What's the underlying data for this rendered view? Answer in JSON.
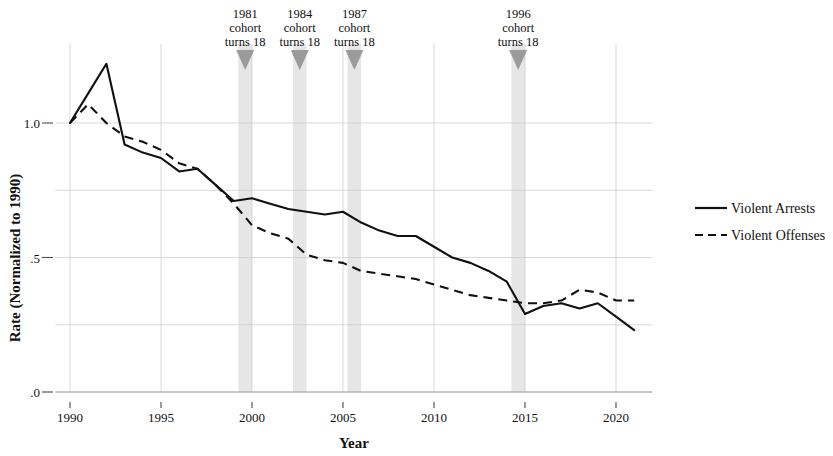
{
  "chart_data": {
    "type": "line",
    "title": "",
    "xlabel": "Year",
    "ylabel": "Rate (Normalized to 1990)",
    "xlim": [
      1989.2,
      2022.0
    ],
    "ylim": [
      0.0,
      1.28
    ],
    "grid": true,
    "legend_position": "right",
    "x_ticks": [
      "1990",
      "1995",
      "2000",
      "2005",
      "2010",
      "2015",
      "2020"
    ],
    "x_tick_values": [
      1990,
      1995,
      2000,
      2005,
      2010,
      2015,
      2020
    ],
    "y_ticks": [
      ".0",
      ".5",
      "1.0"
    ],
    "y_tick_values": [
      0.0,
      0.5,
      1.0
    ],
    "y_gridlines": [
      0.0,
      0.25,
      0.5,
      0.75,
      1.0
    ],
    "x": [
      1990,
      1991,
      1992,
      1993,
      1994,
      1995,
      1996,
      1997,
      1998,
      1999,
      2000,
      2001,
      2002,
      2003,
      2004,
      2005,
      2006,
      2007,
      2008,
      2009,
      2010,
      2011,
      2012,
      2013,
      2014,
      2015,
      2016,
      2017,
      2018,
      2019,
      2020,
      2021
    ],
    "series": [
      {
        "name": "Violent Arrests",
        "style": "solid",
        "values": [
          1.0,
          1.11,
          1.22,
          0.92,
          0.89,
          0.87,
          0.82,
          0.83,
          0.77,
          0.71,
          0.72,
          0.7,
          0.68,
          0.67,
          0.66,
          0.67,
          0.63,
          0.6,
          0.58,
          0.58,
          0.54,
          0.5,
          0.48,
          0.45,
          0.41,
          0.29,
          0.32,
          0.33,
          0.31,
          0.33,
          0.28,
          0.23
        ]
      },
      {
        "name": "Violent Offenses",
        "style": "dashed",
        "values": [
          1.0,
          1.07,
          1.0,
          0.95,
          0.93,
          0.9,
          0.85,
          0.83,
          0.77,
          0.7,
          0.62,
          0.59,
          0.57,
          0.51,
          0.49,
          0.48,
          0.45,
          0.44,
          0.43,
          0.42,
          0.4,
          0.38,
          0.36,
          0.35,
          0.34,
          0.33,
          0.33,
          0.34,
          0.38,
          0.37,
          0.34,
          0.34
        ]
      }
    ],
    "annotations": [
      {
        "year": 1999,
        "band_start": 1999.25,
        "band_end": 2000.0,
        "line1": "1981",
        "line2": "cohort",
        "line3": "turns 18"
      },
      {
        "year": 2002,
        "band_start": 2002.25,
        "band_end": 2003.0,
        "line1": "1984",
        "line2": "cohort",
        "line3": "turns 18"
      },
      {
        "year": 2005,
        "band_start": 2005.25,
        "band_end": 2006.0,
        "line1": "1987",
        "line2": "cohort",
        "line3": "turns 18"
      },
      {
        "year": 2014,
        "band_start": 2014.25,
        "band_end": 2015.0,
        "line1": "1996",
        "line2": "cohort",
        "line3": "turns 18"
      }
    ],
    "colors": {
      "line": "#101010",
      "band": "#e2e2e2",
      "grid": "#c9c9c9",
      "arrow": "#9b9b9b"
    }
  }
}
